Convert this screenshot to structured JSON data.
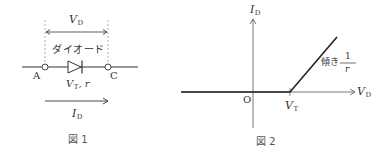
{
  "figure1": {
    "caption": "図 1",
    "voltage_label": {
      "main": "V",
      "sub": "D"
    },
    "component_label": "ダイオード",
    "params_label": {
      "main": "V",
      "sub": "T",
      "rest": ", r"
    },
    "terminal_a": "A",
    "terminal_c": "C",
    "current_label": {
      "main": "I",
      "sub": "D"
    }
  },
  "figure2": {
    "caption": "図 2",
    "y_axis_label": {
      "main": "I",
      "sub": "D"
    },
    "x_axis_label": {
      "main": "V",
      "sub": "D"
    },
    "origin_label": "O",
    "threshold_label": {
      "main": "V",
      "sub": "T"
    },
    "slope_label": {
      "prefix": "傾き",
      "numerator": "1",
      "denominator": "r"
    }
  },
  "colors": {
    "line": "#333333",
    "dashed": "#999999",
    "background": "#ffffff"
  }
}
